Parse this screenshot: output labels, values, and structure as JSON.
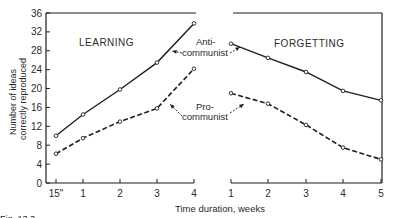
{
  "chart_data": {
    "type": "line",
    "title": "",
    "caption": "Fig. 13.3 (partially visible)",
    "xlabel": "Time duration, weeks",
    "ylabel": "Number of ideas correctly reproduced",
    "ylabel_lines": [
      "Number of ideas",
      "correctly reproduced"
    ],
    "ylim": [
      0,
      36
    ],
    "yticks": [
      0,
      4,
      8,
      12,
      16,
      20,
      24,
      28,
      32,
      36
    ],
    "grid": false,
    "panels": [
      {
        "name": "LEARNING",
        "x": [
          "15\"",
          "1",
          "2",
          "3",
          "4"
        ],
        "series": [
          {
            "name": "Anti-communist",
            "style": "solid",
            "values": [
              10,
              14.5,
              19.8,
              25.5,
              33.8
            ]
          },
          {
            "name": "Pro-communist",
            "style": "dashed",
            "values": [
              6.2,
              9.5,
              13,
              15.8,
              24.2
            ]
          }
        ]
      },
      {
        "name": "FORGETTING",
        "x": [
          "1",
          "2",
          "3",
          "4",
          "5"
        ],
        "series": [
          {
            "name": "Anti-communist",
            "style": "solid",
            "values": [
              29.5,
              26.5,
              23.5,
              19.5,
              17.5
            ]
          },
          {
            "name": "Pro-communist",
            "style": "dashed",
            "values": [
              19,
              16.8,
              12.3,
              7.5,
              5
            ]
          }
        ]
      }
    ],
    "annotations": [
      {
        "text_lines": [
          "Anti-",
          "communist"
        ],
        "points_to": "Anti-communist"
      },
      {
        "text_lines": [
          "Pro-",
          "communist"
        ],
        "points_to": "Pro-communist"
      }
    ]
  },
  "labels": {
    "learning": "LEARNING",
    "forgetting": "FORGETTING",
    "anti_1": "Anti-",
    "anti_2": "communist",
    "pro_1": "Pro-",
    "pro_2": "communist",
    "xlabel": "Time duration, weeks",
    "ylabel_1": "Number of ideas",
    "ylabel_2": "correctly reproduced",
    "caption": "Fig. 13.3"
  }
}
